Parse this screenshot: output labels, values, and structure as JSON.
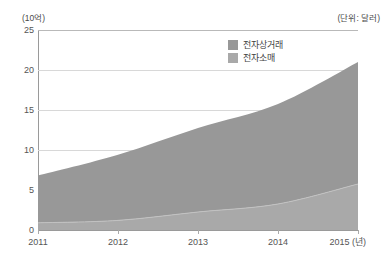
{
  "chart_data": {
    "type": "area",
    "stacked": true,
    "title": "",
    "subtitle": "",
    "xlabel": "(년)",
    "ylabel": "(10억)",
    "unit_note_left": "(10억)",
    "unit_note_right": "(단위: 달러)",
    "x": [
      2011,
      2012,
      2013,
      2014,
      2015
    ],
    "categories": [
      "2011",
      "2012",
      "2013",
      "2014",
      "2015"
    ],
    "xtick_labels": [
      "2011",
      "2012",
      "2013",
      "2014",
      "2015 (년)"
    ],
    "ytick_labels": [
      "0",
      "5",
      "10",
      "15",
      "20",
      "25"
    ],
    "yticks": [
      0,
      5,
      10,
      15,
      20,
      25
    ],
    "ylim": [
      0,
      25
    ],
    "xlim": [
      2011,
      2015
    ],
    "grid": true,
    "legend_position": "top-center",
    "series": [
      {
        "name": "전자상거래",
        "color": "#989898",
        "values": [
          5.9,
          8.2,
          10.5,
          12.5,
          15.3
        ]
      },
      {
        "name": "전자소매",
        "color": "#a9a9a9",
        "values": [
          0.9,
          1.2,
          2.25,
          3.25,
          5.75
        ]
      }
    ],
    "stack_totals": [
      6.8,
      9.4,
      12.75,
      15.75,
      21.0
    ],
    "colors": {
      "ecommerce": "#989898",
      "eretail": "#a9a9a9",
      "gridline": "#d8d8d8",
      "axis": "#9a9a9a",
      "text": "#555555",
      "background": "#ffffff"
    }
  },
  "legend": {
    "items": [
      {
        "label": "전자상거래",
        "color": "#989898"
      },
      {
        "label": "전자소매",
        "color": "#a9a9a9"
      }
    ]
  },
  "axis": {
    "unit_left": "(10억)",
    "unit_right": "(단위: 달러)",
    "y_labels": [
      "25",
      "20",
      "15",
      "10",
      "5",
      "0"
    ],
    "x_labels": [
      "2011",
      "2012",
      "2013",
      "2014",
      "2015 (년)"
    ]
  }
}
